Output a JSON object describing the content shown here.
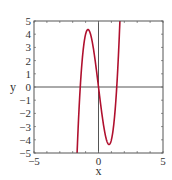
{
  "chart_data": {
    "type": "line",
    "title": "",
    "xlabel": "x",
    "ylabel": "y",
    "xlim": [
      -5,
      5
    ],
    "ylim": [
      -5,
      5
    ],
    "x_ticks": [
      -5,
      0,
      5
    ],
    "x_tick_labels": [
      "-5",
      "0",
      "5"
    ],
    "y_ticks": [
      -5,
      -4,
      -3,
      -2,
      -1,
      0,
      1,
      2,
      3,
      4,
      5
    ],
    "y_tick_labels": [
      "−5",
      "−4",
      "−3",
      "−2",
      "−1",
      "0",
      "1",
      "2",
      "3",
      "4",
      "5"
    ],
    "x_tick_labels_display": [
      "−5",
      "0",
      "5"
    ],
    "minor_ticks_every": 1,
    "grid": false,
    "zero_axes": true,
    "legend": "none",
    "series": [
      {
        "name": "f(x)",
        "function": "4x^3 - 8x",
        "color": "#b0102e",
        "x": [
          -1.68,
          -1.6,
          -1.5,
          -1.414,
          -1.3,
          -1.2,
          -1.1,
          -1.0,
          -0.9,
          -0.816,
          -0.7,
          -0.6,
          -0.5,
          -0.4,
          -0.3,
          -0.2,
          -0.1,
          0.0,
          0.1,
          0.2,
          0.3,
          0.4,
          0.5,
          0.6,
          0.7,
          0.816,
          0.9,
          1.0,
          1.1,
          1.2,
          1.3,
          1.414,
          1.5,
          1.6,
          1.68
        ],
        "y": [
          -5.52,
          -3.58,
          -1.5,
          0.0,
          1.61,
          2.69,
          3.48,
          4.0,
          4.28,
          4.35,
          4.23,
          3.94,
          3.5,
          2.94,
          2.29,
          1.57,
          0.8,
          0.0,
          -0.8,
          -1.57,
          -2.29,
          -2.94,
          -3.5,
          -3.94,
          -4.23,
          -4.35,
          -4.28,
          -4.0,
          -3.48,
          -2.69,
          -1.61,
          0.0,
          1.5,
          3.58,
          5.52
        ]
      }
    ],
    "extrema": [
      {
        "type": "local-max",
        "x": -0.82,
        "y": 4.35
      },
      {
        "type": "local-min",
        "x": 0.82,
        "y": -4.35
      }
    ],
    "roots": [
      -1.41,
      0,
      1.41
    ]
  }
}
